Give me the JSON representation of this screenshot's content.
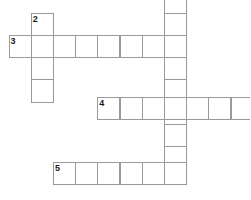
{
  "puzzle": {
    "type": "crossword-grid",
    "title": "",
    "cell_size": 22.2,
    "border_color": "#9a9a9a",
    "background_color": "#ffffff",
    "number_color": "#1a1a1a",
    "origin": {
      "x": 8.5,
      "y": 12.8
    },
    "entries": [
      {
        "number": "1",
        "direction": "down",
        "length": 8,
        "start_col": 7,
        "start_row": -1,
        "cells": [
          "",
          "",
          "",
          "",
          "",
          "",
          "",
          ""
        ]
      },
      {
        "number": "2",
        "direction": "down",
        "length": 4,
        "start_col": 1,
        "start_row": 0,
        "cells": [
          "",
          "",
          "",
          ""
        ]
      },
      {
        "number": "3",
        "direction": "across",
        "length": 8,
        "start_col": 0,
        "start_row": 1,
        "cells": [
          "",
          "",
          "",
          "",
          "",
          "",
          "",
          ""
        ]
      },
      {
        "number": "4",
        "direction": "across",
        "length": 7,
        "start_col": 4,
        "start_row": 3.8,
        "cells": [
          "",
          "",
          "",
          "",
          "",
          "",
          ""
        ]
      },
      {
        "number": "5",
        "direction": "across",
        "length": 6,
        "start_col": 2,
        "start_row": 6.7,
        "cells": [
          "",
          "",
          "",
          "",
          "",
          ""
        ]
      }
    ],
    "numbered_cells": [
      {
        "label": "1",
        "col": 7,
        "row": -1
      },
      {
        "label": "2",
        "col": 1,
        "row": 0
      },
      {
        "label": "3",
        "col": 0,
        "row": 1
      },
      {
        "label": "4",
        "col": 4,
        "row": 3.8
      },
      {
        "label": "5",
        "col": 2,
        "row": 6.7
      }
    ]
  }
}
